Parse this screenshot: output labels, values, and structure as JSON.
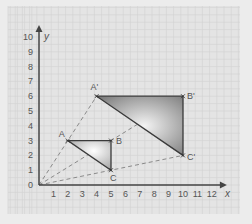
{
  "diagram": {
    "type": "coordinate-plane-enlargement",
    "axes": {
      "x_label": "x",
      "y_label": "y",
      "x_ticks": [
        "0",
        "1",
        "2",
        "3",
        "4",
        "5",
        "6",
        "7",
        "8",
        "9",
        "10",
        "11",
        "12"
      ],
      "y_ticks": [
        "0",
        "1",
        "2",
        "3",
        "4",
        "5",
        "6",
        "7",
        "8",
        "9",
        "10"
      ],
      "x_range": [
        0,
        12
      ],
      "y_range": [
        0,
        10
      ],
      "grid": "minor 0.5-unit graph paper"
    },
    "original_triangle": {
      "label": "ABC",
      "points": [
        {
          "name": "A",
          "x": 2,
          "y": 3
        },
        {
          "name": "B",
          "x": 5,
          "y": 3
        },
        {
          "name": "C",
          "x": 5,
          "y": 1
        }
      ]
    },
    "image_triangle": {
      "label": "A'B'C'",
      "points": [
        {
          "name": "A'",
          "x": 4,
          "y": 6
        },
        {
          "name": "B'",
          "x": 10,
          "y": 6
        },
        {
          "name": "C'",
          "x": 10,
          "y": 2
        }
      ]
    },
    "centre_of_enlargement": {
      "x": 0,
      "y": 0
    },
    "scale_factor": 2,
    "rays": "dashed lines from origin through A, B, C to A', B', C'"
  },
  "colors": {
    "background": "#ececec",
    "paper": "#e4e4e4",
    "grid_minor": "#d2d2d2",
    "grid_major": "#c6c6c6",
    "axis": "#444444",
    "triangle_edge": "#3a3a3a",
    "image_fill_dark": "#7a7a7a",
    "image_fill_light": "#f4f4f4",
    "ray": "#8a8a8a",
    "label": "#555555"
  }
}
